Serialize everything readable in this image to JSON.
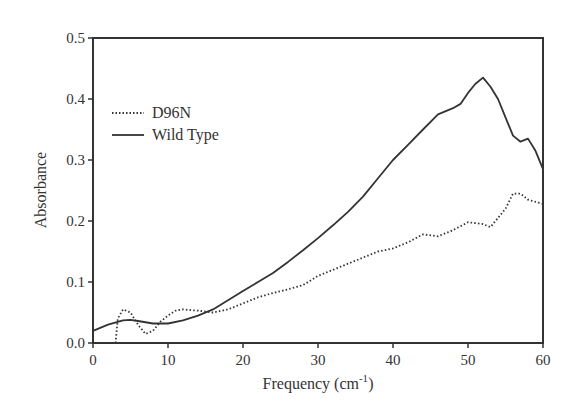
{
  "chart_data": {
    "type": "line",
    "title": "",
    "xlabel": "Frequency (cm-1)",
    "xlabel_main": "Frequency (cm",
    "xlabel_sup": "-1",
    "xlabel_close": ")",
    "ylabel": "Absorbance",
    "xlim": [
      0,
      60
    ],
    "ylim": [
      0.0,
      0.5
    ],
    "xticks": [
      "0",
      "10",
      "20",
      "30",
      "40",
      "50",
      "60"
    ],
    "yticks": [
      "0.0",
      "0.1",
      "0.2",
      "0.3",
      "0.4",
      "0.5"
    ],
    "grid": false,
    "legend_position": "upper left",
    "series": [
      {
        "name": "D96N",
        "style": "dotted",
        "x": [
          3,
          3.3,
          4,
          5,
          6,
          7,
          8,
          9,
          10,
          11,
          12,
          14,
          16,
          18,
          20,
          22,
          24,
          26,
          28,
          30,
          32,
          34,
          36,
          38,
          40,
          42,
          44,
          46,
          48,
          50,
          52,
          53,
          55,
          56,
          57,
          58,
          60
        ],
        "values": [
          0.0,
          0.04,
          0.055,
          0.05,
          0.03,
          0.015,
          0.02,
          0.035,
          0.045,
          0.053,
          0.055,
          0.053,
          0.05,
          0.055,
          0.065,
          0.075,
          0.082,
          0.088,
          0.095,
          0.11,
          0.12,
          0.13,
          0.14,
          0.15,
          0.155,
          0.165,
          0.178,
          0.175,
          0.185,
          0.198,
          0.195,
          0.19,
          0.22,
          0.245,
          0.245,
          0.235,
          0.228
        ]
      },
      {
        "name": "Wild Type",
        "style": "solid",
        "x": [
          0,
          2,
          4,
          5,
          6,
          8,
          10,
          12,
          14,
          16,
          18,
          20,
          22,
          24,
          26,
          28,
          30,
          32,
          34,
          36,
          38,
          40,
          42,
          44,
          46,
          48,
          49,
          50,
          51,
          52,
          53,
          54,
          55,
          56,
          57,
          58,
          59,
          60
        ],
        "values": [
          0.02,
          0.03,
          0.037,
          0.038,
          0.036,
          0.032,
          0.032,
          0.037,
          0.045,
          0.055,
          0.07,
          0.085,
          0.1,
          0.115,
          0.133,
          0.152,
          0.172,
          0.193,
          0.215,
          0.24,
          0.27,
          0.3,
          0.325,
          0.35,
          0.375,
          0.385,
          0.392,
          0.41,
          0.425,
          0.435,
          0.42,
          0.4,
          0.37,
          0.34,
          0.33,
          0.335,
          0.315,
          0.285
        ]
      }
    ]
  },
  "legend": {
    "items": [
      {
        "label": "D96N"
      },
      {
        "label": "Wild Type"
      }
    ]
  }
}
